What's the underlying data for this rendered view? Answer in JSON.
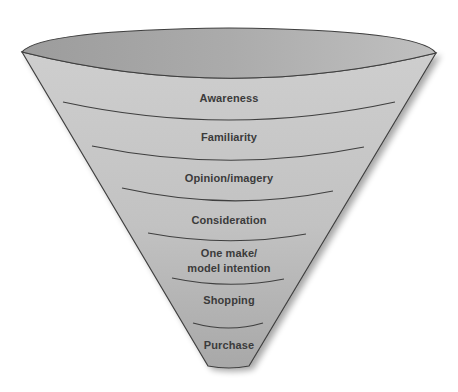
{
  "diagram": {
    "type": "funnel",
    "colors": {
      "rim_interior_left": "#9f9f9f",
      "rim_interior_right": "#bdbdbd",
      "body_top": "#cdcdcd",
      "body_bottom": "#a9a9a9",
      "outline": "#3f3f3f",
      "label_text": "#3b3b3b",
      "background": "#ffffff"
    },
    "stages": [
      {
        "label": "Awareness",
        "lines": [
          "Awareness"
        ],
        "x": 229,
        "y": 98
      },
      {
        "label": "Familiarity",
        "lines": [
          "Familiarity"
        ],
        "x": 229,
        "y": 137
      },
      {
        "label": "Opinion/imagery",
        "lines": [
          "Opinion/imagery"
        ],
        "x": 229,
        "y": 178
      },
      {
        "label": "Consideration",
        "lines": [
          "Consideration"
        ],
        "x": 229,
        "y": 220
      },
      {
        "label": "One make/ model intention",
        "lines": [
          "One make/",
          "model intention"
        ],
        "x": 229,
        "y": 260
      },
      {
        "label": "Shopping",
        "lines": [
          "Shopping"
        ],
        "x": 229,
        "y": 300
      },
      {
        "label": "Purchase",
        "lines": [
          "Purchase"
        ],
        "x": 229,
        "y": 345
      }
    ]
  }
}
